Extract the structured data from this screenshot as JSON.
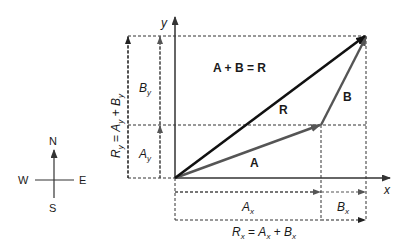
{
  "diagram": {
    "title_equation": "A + B = R",
    "axes": {
      "x_label": "x",
      "y_label": "y"
    },
    "vectors": [
      {
        "name": "A",
        "label": "A",
        "from": [
          0,
          0
        ],
        "to": [
          146,
          53
        ],
        "color": "#555555"
      },
      {
        "name": "B",
        "label": "B",
        "from": [
          146,
          53
        ],
        "to": [
          191,
          142
        ],
        "color": "#555555"
      },
      {
        "name": "R",
        "label": "R",
        "from": [
          0,
          0
        ],
        "to": [
          191,
          142
        ],
        "color": "#111111"
      }
    ],
    "components": {
      "Ax": {
        "main": "A",
        "sub": "x"
      },
      "Bx": {
        "main": "B",
        "sub": "x"
      },
      "Ay": {
        "main": "A",
        "sub": "y"
      },
      "By": {
        "main": "B",
        "sub": "y"
      },
      "Rx_equation": {
        "lhs": "R",
        "lhs_sub": "x",
        "eq": " = ",
        "t1": "A",
        "t1_sub": "x",
        "plus": " + ",
        "t2": "B",
        "t2_sub": "x"
      },
      "Ry_equation": {
        "lhs": "R",
        "lhs_sub": "y",
        "eq": " = ",
        "t1": "A",
        "t1_sub": "y",
        "plus": " + ",
        "t2": "B",
        "t2_sub": "y"
      }
    },
    "compass": {
      "north": "N",
      "south": "S",
      "east": "E",
      "west": "W"
    },
    "colors": {
      "dark": "#111111",
      "gray": "#555555",
      "dash": "#333333"
    }
  }
}
